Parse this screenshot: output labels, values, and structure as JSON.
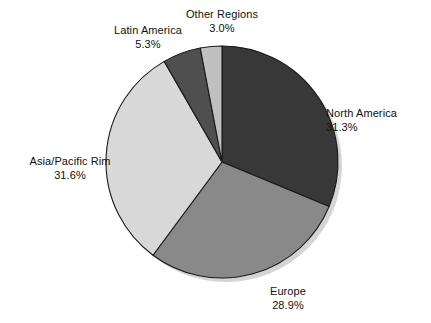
{
  "chart_data": {
    "type": "pie",
    "title": "",
    "subtitle": "",
    "xlabel": "",
    "ylabel": "",
    "legend_position": "none",
    "grid": false,
    "units": "percent",
    "labels_outside": true,
    "start_angle_deg": 0,
    "direction": "clockwise",
    "categories": [
      "North America",
      "Europe",
      "Asia/Pacific Rim",
      "Latin America",
      "Other Regions"
    ],
    "values": [
      31.3,
      28.9,
      31.6,
      5.3,
      3.0
    ],
    "colors": [
      "#383838",
      "#898989",
      "#d8d8d8",
      "#4f4f4f",
      "#c0c0c0"
    ],
    "slices": [
      {
        "name": "North America",
        "value": 31.3,
        "value_label": "31.3%",
        "color": "#383838",
        "start_deg": 0.0,
        "end_deg": 112.68
      },
      {
        "name": "Europe",
        "value": 28.9,
        "value_label": "28.9%",
        "color": "#898989",
        "start_deg": 112.68,
        "end_deg": 216.72
      },
      {
        "name": "Asia/Pacific Rim",
        "value": 31.6,
        "value_label": "31.6%",
        "color": "#d8d8d8",
        "start_deg": 216.72,
        "end_deg": 330.48
      },
      {
        "name": "Latin America",
        "value": 5.3,
        "value_label": "5.3%",
        "color": "#4f4f4f",
        "start_deg": 330.48,
        "end_deg": 349.56
      },
      {
        "name": "Other Regions",
        "value": 3.0,
        "value_label": "3.0%",
        "color": "#c0c0c0",
        "start_deg": 349.56,
        "end_deg": 360.0
      }
    ]
  },
  "labels": {
    "north_america": {
      "name": "North America",
      "value": "31.3%"
    },
    "europe": {
      "name": "Europe",
      "value": "28.9%"
    },
    "asia_pacific": {
      "name": "Asia/Pacific Rim",
      "value": "31.6%"
    },
    "latin_america": {
      "name": "Latin America",
      "value": "5.3%"
    },
    "other_regions": {
      "name": "Other Regions",
      "value": "3.0%"
    }
  },
  "style": {
    "background": "#ffffff",
    "text_color": "#101010",
    "outline_color": "#1a1a1a",
    "shadow_color": "#d4d4d4"
  }
}
